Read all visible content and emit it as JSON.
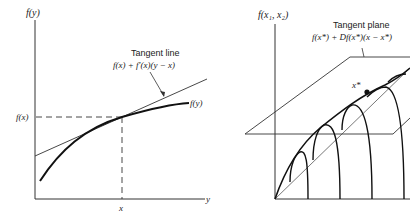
{
  "left_panel": {
    "y_axis_label": "f(y)",
    "x_axis_label": "y",
    "x_tick_label": "x",
    "y_tick_label": "f(x)",
    "curve_label": "f(y)",
    "annotation_title": "Tangent line",
    "annotation_formula": "f(x) + f′(x)(y − x)"
  },
  "right_panel": {
    "z_axis_label": "f(x₁, x₂)",
    "point_label": "x*",
    "annotation_title": "Tangent plane",
    "annotation_formula": "f(x*) + Df(x*)(x − x*)"
  },
  "colors": {
    "ink": "#222222",
    "background": "#ffffff"
  }
}
